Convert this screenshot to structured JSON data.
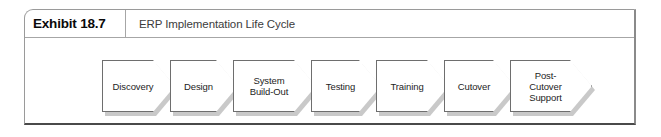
{
  "exhibit": {
    "number_label": "Exhibit 18.7",
    "title": "ERP Implementation Life Cycle"
  },
  "flow": {
    "steps": [
      {
        "label": "Discovery",
        "left": 77,
        "width": 73
      },
      {
        "label": "Design",
        "left": 145,
        "width": 68
      },
      {
        "label": "System\nBuild-Out",
        "left": 208,
        "width": 83
      },
      {
        "label": "Testing",
        "left": 286,
        "width": 70
      },
      {
        "label": "Training",
        "left": 351,
        "width": 73
      },
      {
        "label": "Cutover",
        "left": 419,
        "width": 71
      },
      {
        "label": "Post-\nCutover\nSupport",
        "left": 485,
        "width": 82
      }
    ]
  },
  "colors": {
    "shape_fill": "#ffffff",
    "shape_stroke": "#6e6e6e",
    "shadow": "#c9c9c9",
    "frame_border": "#9a9a9a",
    "frame_bottom": "#4a4a4a",
    "title_text": "#3c3c3c",
    "number_text": "#0a0a0a"
  }
}
